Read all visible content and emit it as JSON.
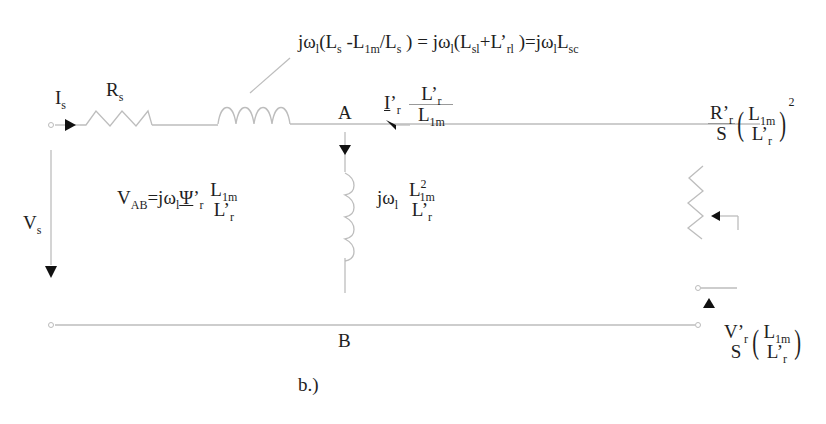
{
  "diagram": {
    "type": "equivalent-circuit",
    "caption": "b.)",
    "nodes": {
      "top": "A",
      "bottom": "B"
    },
    "labels": {
      "stator_current": {
        "main": "I",
        "sub": "s"
      },
      "stator_resistance": {
        "main": "R",
        "sub": "s"
      },
      "stator_voltage": {
        "main": "V",
        "sub": "s"
      },
      "leakage_inductance": {
        "part1": "jω",
        "p1sub": "l",
        "part2": "(L",
        "p2sub": "s",
        "part3": " -L",
        "p3sub": "1m",
        "part4": "/L",
        "p4sub": "s",
        "part5": " ) = jω",
        "p5sub": "l",
        "part6": "(L",
        "p6sub": "sl",
        "part7": "+L’",
        "p7sub": "rl",
        "part8": " )=jω",
        "p8sub": "l",
        "part9": "L",
        "p9sub": "sc"
      },
      "rotor_current": {
        "main": "I",
        "prime": "’",
        "sub": "r",
        "num_main": "L’",
        "num_sub": "r",
        "den_main": "L",
        "den_sub": "1m"
      },
      "magnetizing": {
        "main": "jω",
        "sub": "l",
        "num_main": "L",
        "num_sup": "2",
        "num_sub": "1m",
        "den_main": "L’",
        "den_sub": "r"
      },
      "vab": {
        "main": "V",
        "sub": "AB",
        "eq": "=jω",
        "eq_sub": "l",
        "psi": "Ψ",
        "psi_prime": "’",
        "psi_sub": "r",
        "num_main": "L",
        "num_sub": "1m",
        "den_main": "L’",
        "den_sub": "r"
      },
      "rotor_resistance": {
        "num_main": "R’",
        "num_sub": "r",
        "den": "S",
        "in_num_main": "L",
        "in_num_sub": "1m",
        "in_den_main": "L’",
        "in_den_sub": "r",
        "power": "2"
      },
      "rotor_voltage": {
        "num_main": "V’",
        "num_sub": "r",
        "den": "S",
        "in_num_main": "L",
        "in_num_sub": "1m",
        "in_den_main": "L’",
        "in_den_sub": "r"
      }
    },
    "colors": {
      "wire": "#bdbdbd",
      "arrow": "#111111",
      "text": "#1e1e1e"
    }
  }
}
